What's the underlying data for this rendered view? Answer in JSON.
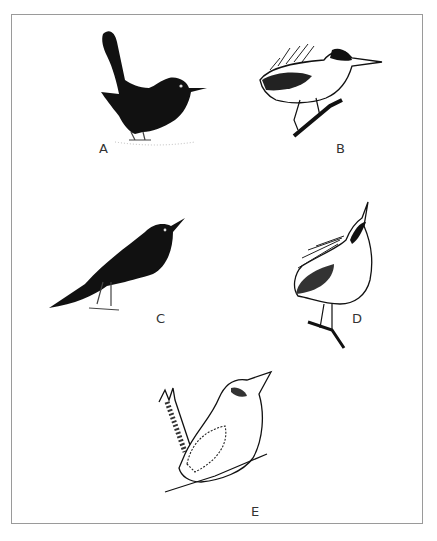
{
  "figure": {
    "panels": [
      {
        "id": "A",
        "label": "A",
        "description": "Black bird with raised tail standing on ground",
        "icon": "bird-icon-dark-raised-tail"
      },
      {
        "id": "B",
        "label": "B",
        "description": "Black bird with long tail, looking up, standing on ground",
        "icon": "bird-icon-dark-long-tail"
      },
      {
        "id": "C",
        "label": "C",
        "description": "Crested bird with black cap perched on branch, ruffled feathers",
        "icon": "bird-icon-crested-perched"
      },
      {
        "id": "D",
        "label": "D",
        "description": "Crested bird pointing bill upward, perched on branch",
        "icon": "bird-icon-crested-upward"
      },
      {
        "id": "E",
        "label": "E",
        "description": "Kingfisher-like bird with cocked tail perched on branch, bill raised",
        "icon": "bird-icon-kookaburra"
      }
    ],
    "colors": {
      "frame": "#9a9a9a",
      "ink": "#111111",
      "label": "#333333"
    }
  }
}
